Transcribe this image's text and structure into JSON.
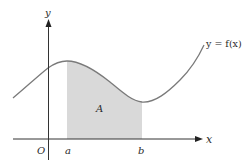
{
  "diagram": {
    "type": "area-under-curve",
    "colors": {
      "axis": "#333333",
      "curve": "#7a7a7a",
      "shade": "#d9d9d9",
      "text": "#2a2a2a"
    },
    "labels": {
      "y_axis": "y",
      "x_axis": "x",
      "origin": "O",
      "a": "a",
      "b": "b",
      "area": "A",
      "curve": "y = f(x)"
    }
  }
}
